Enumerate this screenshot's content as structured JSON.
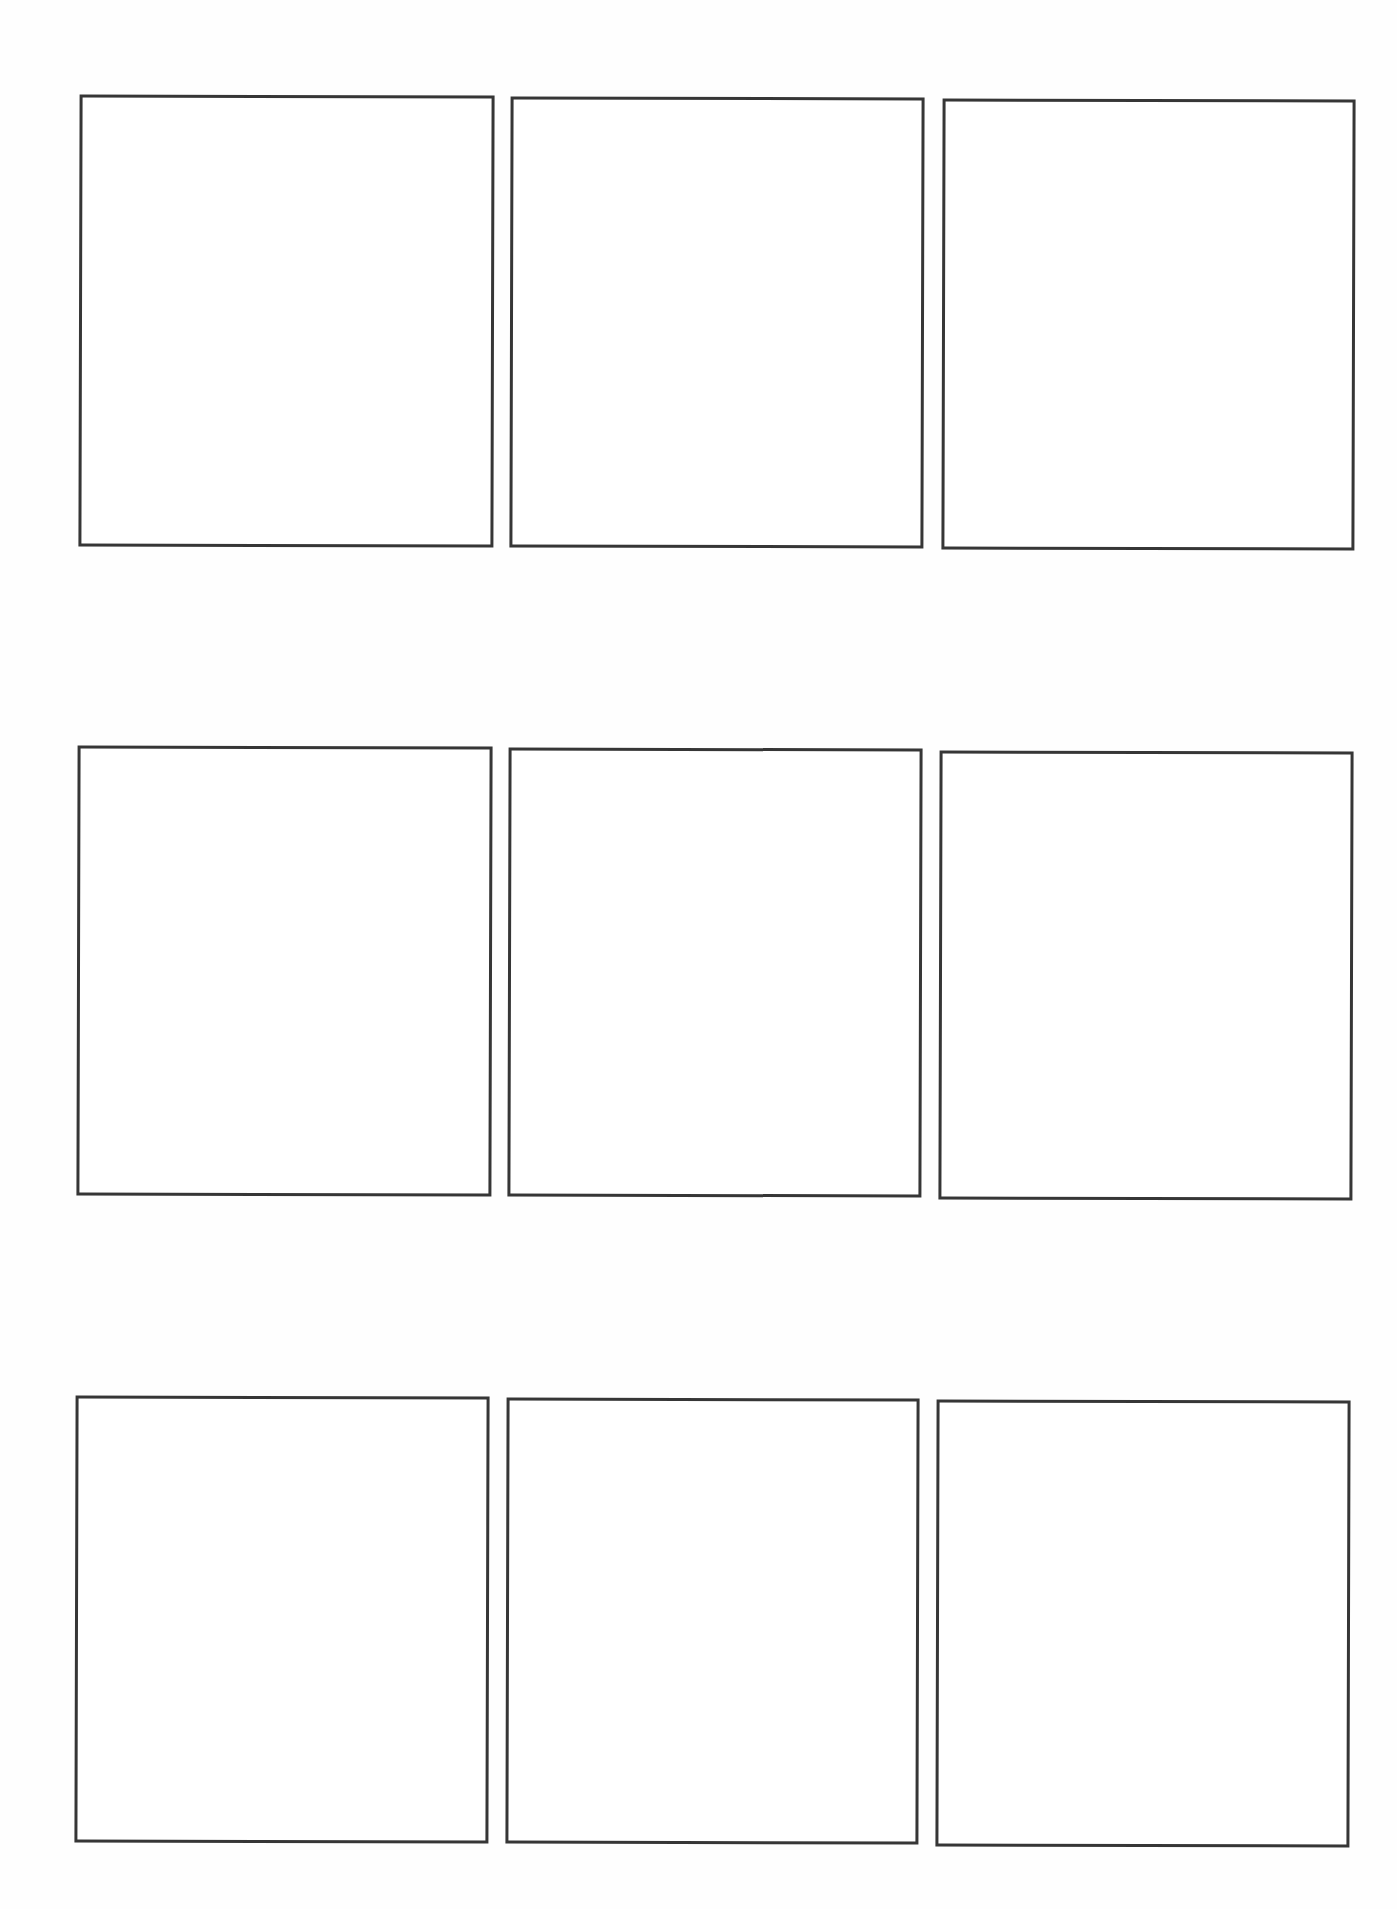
{
  "page": {
    "background": "#ffffff",
    "border_color": "#363636",
    "layout": "3x3 grid of empty comic panels"
  },
  "panels": [
    {
      "row": 1,
      "col": 1,
      "x": 79,
      "y": 95,
      "w": 415,
      "h": 452,
      "rot": 0.15
    },
    {
      "row": 1,
      "col": 2,
      "x": 510,
      "y": 97,
      "w": 414,
      "h": 451,
      "rot": 0.15
    },
    {
      "row": 1,
      "col": 3,
      "x": 942,
      "y": 99,
      "w": 413,
      "h": 451,
      "rot": 0.15
    },
    {
      "row": 2,
      "col": 1,
      "x": 77,
      "y": 746,
      "w": 415,
      "h": 450,
      "rot": 0.15
    },
    {
      "row": 2,
      "col": 2,
      "x": 508,
      "y": 748,
      "w": 414,
      "h": 449,
      "rot": 0.15
    },
    {
      "row": 2,
      "col": 3,
      "x": 939,
      "y": 751,
      "w": 414,
      "h": 449,
      "rot": 0.15
    },
    {
      "row": 3,
      "col": 1,
      "x": 75,
      "y": 1396,
      "w": 414,
      "h": 447,
      "rot": 0.15
    },
    {
      "row": 3,
      "col": 2,
      "x": 506,
      "y": 1398,
      "w": 413,
      "h": 446,
      "rot": 0.15
    },
    {
      "row": 3,
      "col": 3,
      "x": 936,
      "y": 1400,
      "w": 414,
      "h": 447,
      "rot": 0.15
    }
  ]
}
